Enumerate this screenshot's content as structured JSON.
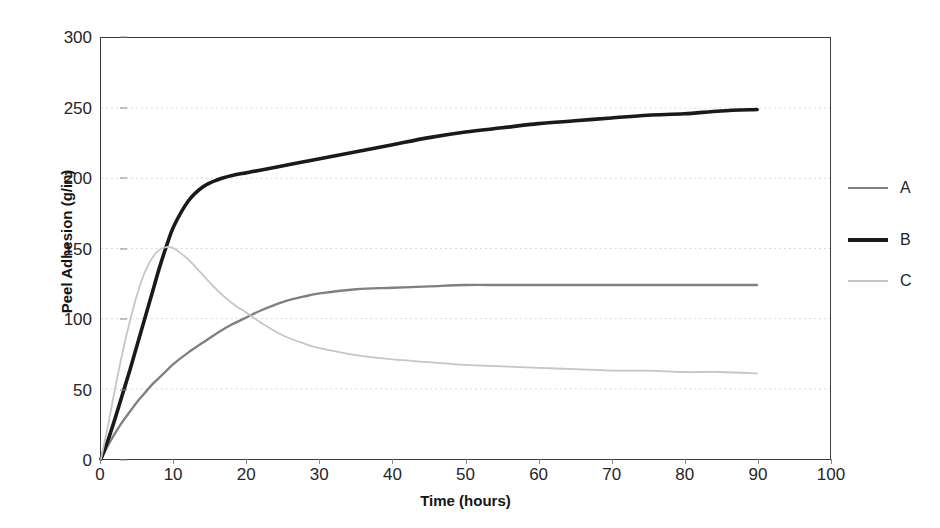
{
  "chart_data": {
    "type": "line",
    "title": "",
    "xlabel": "Time (hours)",
    "ylabel": "Peel Adhesion (g/in)",
    "xlim": [
      0,
      100
    ],
    "ylim": [
      0,
      300
    ],
    "xticks": [
      0,
      10,
      20,
      30,
      40,
      50,
      60,
      70,
      80,
      90,
      100
    ],
    "yticks": [
      0,
      50,
      100,
      150,
      200,
      250,
      300
    ],
    "grid": "horizontal",
    "legend_position": "right",
    "x": [
      0,
      1,
      2,
      3,
      4,
      5,
      6,
      7,
      8,
      9,
      10,
      12,
      14,
      16,
      18,
      20,
      22,
      25,
      28,
      30,
      35,
      40,
      45,
      50,
      55,
      60,
      65,
      70,
      75,
      80,
      85,
      90
    ],
    "series": [
      {
        "name": "A",
        "color": "#808080",
        "width": 2.4,
        "values": [
          0,
          10,
          19,
          27,
          34,
          41,
          47,
          53,
          58,
          63,
          68,
          76,
          83,
          90,
          96,
          101,
          106,
          112,
          116,
          118,
          121,
          122,
          123,
          124,
          124,
          124,
          124,
          124,
          124,
          124,
          124,
          124
        ]
      },
      {
        "name": "B",
        "color": "#1a1a1a",
        "width": 3.6,
        "values": [
          0,
          14,
          30,
          47,
          64,
          82,
          100,
          118,
          136,
          152,
          166,
          184,
          194,
          199,
          202,
          204,
          206,
          209,
          212,
          214,
          219,
          224,
          229,
          233,
          236,
          239,
          241,
          243,
          245,
          246,
          248,
          249
        ]
      },
      {
        "name": "C",
        "color": "#c6c6c6",
        "width": 1.8,
        "values": [
          0,
          25,
          52,
          77,
          99,
          118,
          133,
          143,
          149,
          151,
          150,
          142,
          131,
          120,
          111,
          104,
          97,
          88,
          82,
          79,
          74,
          71,
          69,
          67,
          66,
          65,
          64,
          63,
          63,
          62,
          62,
          61
        ]
      }
    ],
    "annotations": []
  },
  "legend": {
    "items": [
      {
        "label": "A",
        "y": 188
      },
      {
        "label": "B",
        "y": 240
      },
      {
        "label": "C",
        "y": 281
      }
    ]
  }
}
